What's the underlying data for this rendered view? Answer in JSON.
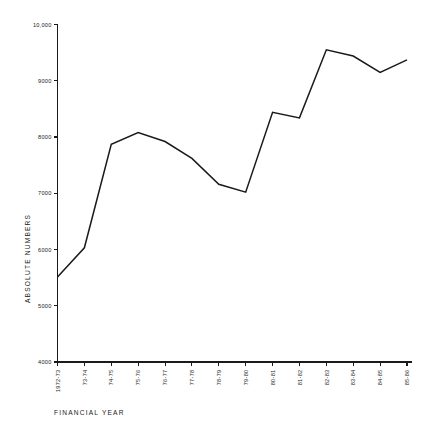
{
  "figure": {
    "top_cropped_text": "",
    "background_color": "#ffffff",
    "line_color": "#1a1a1a"
  },
  "axes": {
    "y_title": "ABSOLUTE  NUMBERS",
    "x_title": "FINANCIAL YEAR",
    "y_tick_labels": [
      "10,000",
      "9000",
      "8000",
      "7000",
      "6000",
      "5000",
      "4000"
    ],
    "y_tick_values": [
      10000,
      9000,
      8000,
      7000,
      6000,
      5000,
      4000
    ]
  },
  "chart_data": {
    "type": "line",
    "title": "",
    "subtitle": "",
    "xlabel": "FINANCIAL YEAR",
    "ylabel": "ABSOLUTE  NUMBERS",
    "categories": [
      "1972-73",
      "73-74",
      "74-75",
      "75-76",
      "76-77",
      "77-78",
      "78-79",
      "79-80",
      "80-81",
      "81-82",
      "82-83",
      "83-84",
      "84-85",
      "85-86"
    ],
    "values": [
      5510,
      6030,
      7870,
      8080,
      7920,
      7620,
      7160,
      7020,
      8440,
      8340,
      9550,
      9440,
      9150,
      9370
    ],
    "ylim": [
      4000,
      10000
    ],
    "yticks": [
      4000,
      5000,
      6000,
      7000,
      8000,
      9000,
      10000
    ],
    "ytick_labels": [
      "4000",
      "5000",
      "6000",
      "7000",
      "8000",
      "9000",
      "10,000"
    ],
    "grid": false,
    "legend": null,
    "legend_position": "none",
    "markers": false,
    "line_color": "#1a1a1a",
    "line_width": 1.5,
    "annotations": []
  }
}
